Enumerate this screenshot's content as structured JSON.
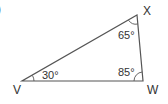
{
  "diagram": {
    "part_marker": ")",
    "vertices": [
      {
        "name": "V",
        "x": 22,
        "y": 81
      },
      {
        "name": "W",
        "x": 143,
        "y": 81
      },
      {
        "name": "X",
        "x": 137,
        "y": 15
      }
    ],
    "angles": [
      {
        "vertex": "V",
        "label": "30°"
      },
      {
        "vertex": "X",
        "label": "65°"
      },
      {
        "vertex": "W",
        "label": "85°"
      }
    ],
    "colors": {
      "line": "#555555",
      "text": "#333333"
    }
  }
}
